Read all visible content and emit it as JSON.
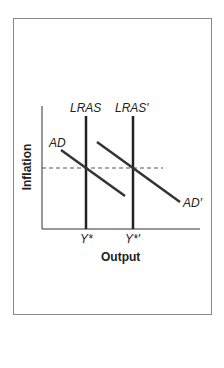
{
  "labels": {
    "lras": "LRAS",
    "lras_prime": "LRAS′",
    "ad": "AD",
    "ad_prime": "AD′",
    "y_star": "Y*",
    "y_star_prime": "Y*′",
    "x_axis": "Output",
    "y_axis": "Inflation"
  }
}
